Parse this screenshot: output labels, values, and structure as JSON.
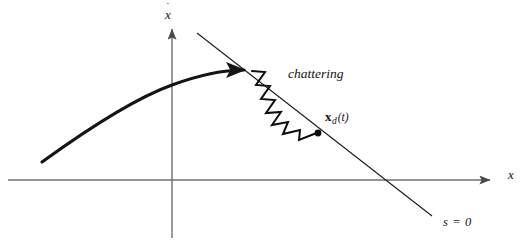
{
  "figure": {
    "width": 527,
    "height": 251,
    "background_color": "#ffffff"
  },
  "axes": {
    "origin": {
      "x": 172,
      "y": 180
    },
    "color": "#6f6f6f",
    "stroke_width": 1.4,
    "horizontal": {
      "name": "x-axis",
      "label": "x",
      "x_start": 8,
      "x_end": 497,
      "y": 180,
      "arrow": "right"
    },
    "vertical": {
      "name": "xdot-axis",
      "label_base": "x",
      "label_accent": "˙",
      "label_full": "ẋ",
      "x": 172,
      "y_start": 238,
      "y_end": 22,
      "arrow": "up"
    }
  },
  "sliding_surface": {
    "name": "sliding-line",
    "label": "s = 0",
    "label_position": {
      "x": 443,
      "y": 216
    },
    "color": "#1a1a1a",
    "stroke_width": 1.1,
    "start": {
      "x": 197,
      "y": 33
    },
    "end": {
      "x": 432,
      "y": 216
    },
    "x_axis_crossing": {
      "x": 382,
      "y": 180
    }
  },
  "trajectory": {
    "name": "approach-trajectory",
    "color": "#141414",
    "stroke_width": 3.1,
    "path": "M 42 162 C 78 136, 130 100, 172 85 C 202 74, 226 70, 246 70",
    "arrowhead": {
      "tip": {
        "x": 252,
        "y": 70
      },
      "direction_deg": 0
    }
  },
  "chattering": {
    "name": "chattering-zigzag",
    "label": "chattering",
    "label_position": {
      "x": 288,
      "y": 67
    },
    "color": "#0d0d0d",
    "stroke_width": 2.0,
    "start": {
      "x": 252,
      "y": 71
    },
    "end": {
      "x": 318,
      "y": 133
    },
    "oscillation_count": 7,
    "amplitude_px": 9,
    "endpoint_dot": {
      "x": 318,
      "y": 133,
      "r": 3.4
    }
  },
  "labels": {
    "y_axis": "x",
    "y_axis_accent": "˙",
    "x_axis": "x",
    "chattering": "chattering",
    "desired_state_bold": "x",
    "desired_state_sub": "d",
    "desired_state_arg": "(t)",
    "sliding_surface": "s = 0"
  }
}
